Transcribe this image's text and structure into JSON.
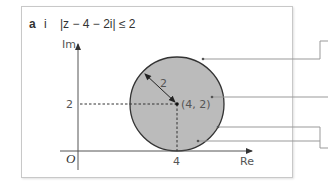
{
  "question": {
    "part": "a",
    "subpart": "i",
    "inequality": "|z − 4 − 2i| ≤ 2"
  },
  "diagram": {
    "y_axis_label": "Im",
    "x_axis_label": "Re",
    "origin_label": "O",
    "y_tick_label": "2",
    "x_tick_label": "4",
    "radius_label": "2",
    "center_label": "(4, 2)",
    "circle": {
      "center": [
        4,
        2
      ],
      "radius": 2,
      "fill": "#bbbbbb",
      "stroke": "#333333"
    },
    "leader_count": 4
  },
  "colors": {
    "axis": "#555555",
    "frame": "#c8c8c8",
    "leader": "#999999",
    "text": "#333333"
  }
}
